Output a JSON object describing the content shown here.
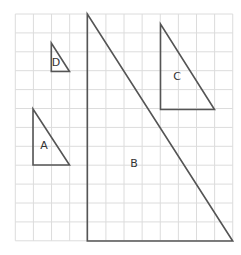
{
  "grid": {
    "x0": 15.3,
    "y0": 14,
    "cols": 12,
    "rows": 12,
    "cell_w": 18.12,
    "cell_h": 18.9,
    "color": "#dcdcdc"
  },
  "stroke_color": "#555555",
  "triangles": [
    {
      "label": "A",
      "points": [
        [
          33,
          109
        ],
        [
          33,
          165
        ],
        [
          69.5,
          165
        ]
      ],
      "label_pos": [
        44,
        146
      ]
    },
    {
      "label": "B",
      "points": [
        [
          87.3,
          14
        ],
        [
          87.3,
          241
        ],
        [
          232.7,
          241
        ]
      ],
      "label_pos": [
        134,
        164
      ]
    },
    {
      "label": "C",
      "points": [
        [
          160.5,
          24
        ],
        [
          160.5,
          109.5
        ],
        [
          214.5,
          109.5
        ]
      ],
      "label_pos": [
        177,
        77
      ]
    },
    {
      "label": "D",
      "points": [
        [
          51.3,
          43
        ],
        [
          51.3,
          71.5
        ],
        [
          69.5,
          71.5
        ]
      ],
      "label_pos": [
        56,
        63
      ]
    }
  ],
  "labels": {
    "a": "A",
    "b": "B",
    "c": "C",
    "d": "D"
  }
}
